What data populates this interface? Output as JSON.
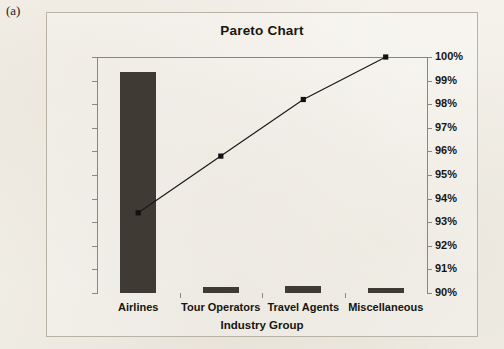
{
  "figure": {
    "label": "(a)"
  },
  "chart_data": {
    "type": "bar",
    "title": "Pareto Chart",
    "xlabel": "Industry Group",
    "ylabel": "",
    "categories": [
      "Airlines",
      "Tour Operators",
      "Travel Agents",
      "Miscellaneous"
    ],
    "series": [
      {
        "name": "Percent",
        "type": "bar",
        "axis": "left",
        "values": [
          93.5,
          2.5,
          2.8,
          2.3
        ]
      },
      {
        "name": "Cumulative",
        "type": "line",
        "axis": "right",
        "values": [
          93.4,
          95.8,
          98.2,
          100.0
        ]
      }
    ],
    "ylim": [
      0,
      100
    ],
    "y2lim": [
      90,
      100
    ],
    "yticks": [
      "0%",
      "10%",
      "20%",
      "30%",
      "40%",
      "50%",
      "60%",
      "70%",
      "80%",
      "90%",
      "100%"
    ],
    "ytick_values": [
      0,
      10,
      20,
      30,
      40,
      50,
      60,
      70,
      80,
      90,
      100
    ],
    "y2ticks": [
      "90%",
      "91%",
      "92%",
      "93%",
      "94%",
      "95%",
      "96%",
      "97%",
      "98%",
      "99%",
      "100%"
    ],
    "y2tick_values": [
      90,
      91,
      92,
      93,
      94,
      95,
      96,
      97,
      98,
      99,
      100
    ],
    "grid": false,
    "legend": "none",
    "colors": {
      "bar": "#3f3a33",
      "line": "#1a1a1a",
      "marker": "#111111",
      "axis": "#8d877a",
      "text": "#17150f",
      "background": "#f3f0e9",
      "frame_border": "#b9b3a6"
    }
  }
}
